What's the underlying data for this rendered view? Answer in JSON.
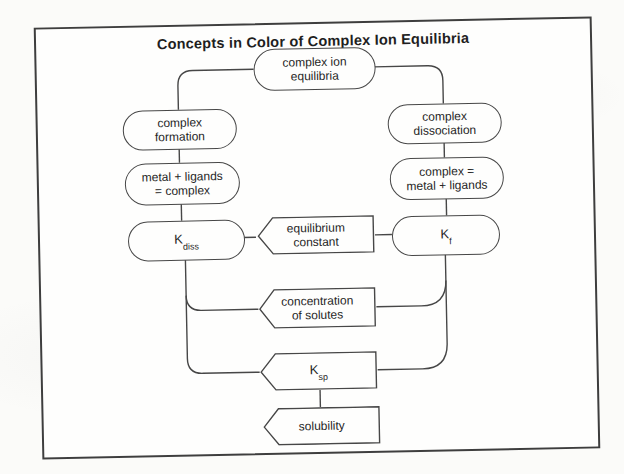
{
  "title": "Concepts in Color of Complex Ion Equilibria",
  "colors": {
    "ink": "#474747",
    "paper": "#fefefd",
    "page_background": "#fbfbf9"
  },
  "nodes": {
    "complex_ion_equilibria": {
      "label": "complex ion\nequilibria"
    },
    "complex_formation": {
      "label": "complex\nformation"
    },
    "complex_dissociation": {
      "label": "complex\ndissociation"
    },
    "formation_equation": {
      "label": "metal + ligands\n= complex"
    },
    "dissociation_equation": {
      "label": "complex =\nmetal + ligands"
    },
    "k_diss": {
      "base": "K",
      "sub": "diss"
    },
    "equilibrium_constant": {
      "label": "equilibrium\nconstant"
    },
    "k_f": {
      "base": "K",
      "sub": "f"
    },
    "concentration_of_solutes": {
      "label": "concentration\nof solutes"
    },
    "k_sp": {
      "base": "K",
      "sub": "sp"
    },
    "solubility": {
      "label": "solubility"
    }
  }
}
